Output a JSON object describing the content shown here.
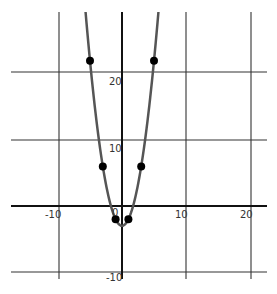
{
  "chart_data": {
    "type": "line",
    "title": "",
    "xlabel": "",
    "ylabel": "",
    "function": "y = x^2 - 3",
    "xlim": [
      -17,
      22
    ],
    "ylim": [
      -11,
      29
    ],
    "grid": true,
    "x_ticks": [
      -10,
      0,
      10,
      20
    ],
    "y_ticks": [
      -10,
      10,
      20
    ],
    "x_tick_labels": [
      "-10",
      "0",
      "10",
      "20"
    ],
    "y_tick_labels": [
      "-10",
      "10",
      "20"
    ],
    "series": [
      {
        "name": "curve",
        "color": "#555555",
        "points": [
          {
            "x": -5,
            "y": 22
          },
          {
            "x": -3,
            "y": 6
          },
          {
            "x": -1,
            "y": -2
          },
          {
            "x": 1,
            "y": -2
          },
          {
            "x": 3,
            "y": 6
          },
          {
            "x": 5,
            "y": 22
          }
        ]
      }
    ],
    "marker_color": "#000000",
    "legend": null
  },
  "labels": {
    "x_neg10": "-10",
    "x_0": "0",
    "x_10": "10",
    "x_20": "20",
    "y_20": "20",
    "y_10": "10",
    "y_neg10": "-10"
  }
}
